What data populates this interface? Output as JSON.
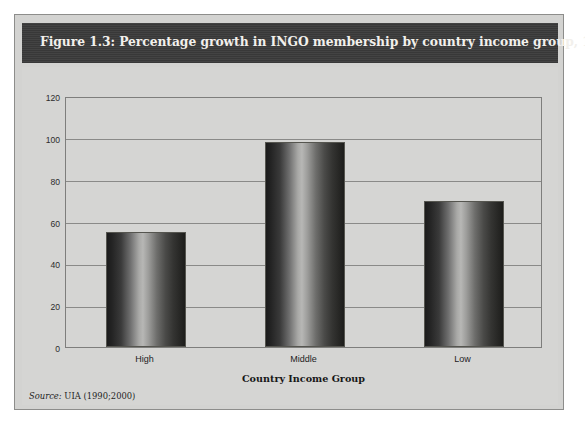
{
  "figure": {
    "title": "Figure 1.3: Percentage growth in INGO membership by country income group, 1990–2000",
    "source_label": "Source:",
    "source_text": "UIA (1990;2000)"
  },
  "colors": {
    "band_background": "#3b3b3b",
    "title_text": "#f2f0ec",
    "figure_background": "#d3d3d1",
    "plot_background": "#d5d5d3",
    "gridline": "#8a8a88",
    "bar_dark": "#1b1b1b",
    "bar_highlight": "#b7b7b5"
  },
  "chart_data": {
    "type": "bar",
    "title": "Figure 1.3: Percentage growth in INGO membership by country income group, 1990–2000",
    "categories": [
      "High",
      "Middle",
      "Low"
    ],
    "values": [
      55,
      98,
      70
    ],
    "xlabel": "Country Income Group",
    "ylabel": "",
    "ylim": [
      0,
      120
    ],
    "yticks": [
      0,
      20,
      40,
      60,
      80,
      100,
      120
    ],
    "ytick_labels": [
      "0",
      "20",
      "40",
      "60",
      "80",
      "100",
      "120"
    ],
    "grid": true,
    "legend": false
  }
}
